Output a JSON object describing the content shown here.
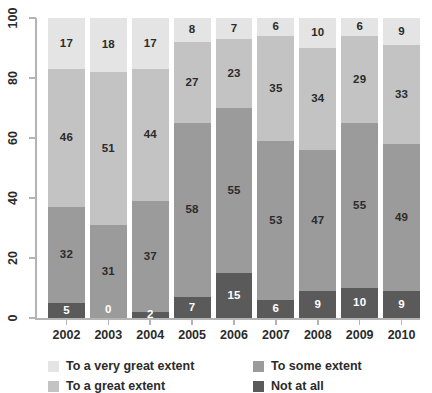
{
  "chart_data": {
    "type": "bar",
    "subtype": "stacked-bar-100-percent",
    "title": "",
    "xlabel": "",
    "ylabel": "",
    "ylim": [
      0,
      100
    ],
    "yticks": [
      0,
      20,
      40,
      60,
      80,
      100
    ],
    "grid": false,
    "legend_position": "bottom",
    "categories": [
      "2002",
      "2003",
      "2004",
      "2005",
      "2006",
      "2007",
      "2008",
      "2009",
      "2010"
    ],
    "series": [
      {
        "name": "Not at all",
        "color": "#5a5a5a",
        "values": [
          5,
          0,
          2,
          7,
          15,
          6,
          9,
          10,
          9
        ]
      },
      {
        "name": "To some extent",
        "color": "#9b9b9b",
        "values": [
          32,
          31,
          37,
          58,
          55,
          53,
          47,
          55,
          49
        ]
      },
      {
        "name": "To a great extent",
        "color": "#c3c3c3",
        "values": [
          46,
          51,
          44,
          27,
          23,
          35,
          34,
          29,
          33
        ]
      },
      {
        "name": "To a very great extent",
        "color": "#e4e4e4",
        "values": [
          17,
          18,
          17,
          8,
          7,
          6,
          10,
          6,
          9
        ]
      }
    ]
  },
  "legend": {
    "entries": [
      {
        "label": "To a very great extent",
        "color": "#e4e4e4"
      },
      {
        "label": "To some extent",
        "color": "#9b9b9b"
      },
      {
        "label": "To a great extent",
        "color": "#c3c3c3"
      },
      {
        "label": "Not at all",
        "color": "#5a5a5a"
      }
    ]
  },
  "axis": {
    "y_tick_labels": [
      "0",
      "20",
      "40",
      "60",
      "80",
      "100"
    ],
    "x_tick_labels": [
      "2002",
      "2003",
      "2004",
      "2005",
      "2006",
      "2007",
      "2008",
      "2009",
      "2010"
    ]
  },
  "colors": {
    "axis_line": "#b4b4b4",
    "text": "#2b2b2b",
    "background": "#ffffff"
  }
}
